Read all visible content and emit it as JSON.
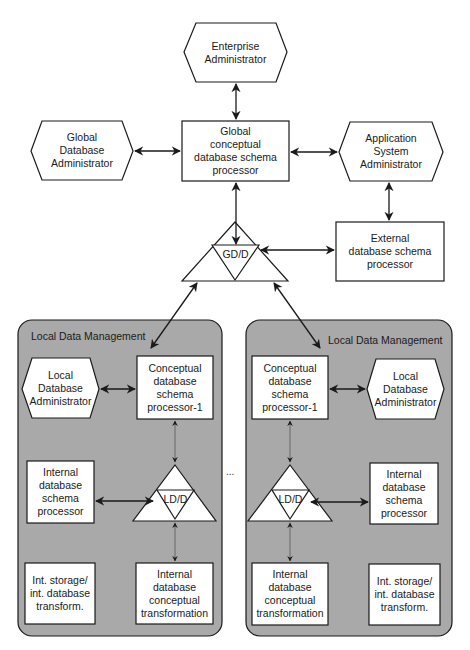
{
  "diagram": {
    "global": {
      "enterprise_admin": "Enterprise\nAdministrator",
      "global_db_admin": "Global\nDatabase\nAdministrator",
      "global_conceptual_processor": "Global\nconceptual\ndatabase schema\nprocessor",
      "application_system_admin": "Application\nSystem\nAdministrator",
      "external_processor": "External\ndatabase schema\nprocessor",
      "gdd": "GD/D"
    },
    "left_panel": {
      "title": "Local Data Management",
      "local_db_admin": "Local\nDatabase\nAdministrator",
      "conceptual_processor": "Conceptual\ndatabase\nschema\nprocessor-1",
      "internal_schema_processor": "Internal\ndatabase\nschema\nprocessor",
      "ldd": "LD/D",
      "int_storage": "Int. storage/\nint. database\ntransform.",
      "internal_conceptual_transformation": "Internal\ndatabase\nconceptual\ntransformation"
    },
    "right_panel": {
      "title": "Local Data Management",
      "local_db_admin": "Local\nDatabase\nAdministrator",
      "conceptual_processor": "Conceptual\ndatabase\nschema\nprocessor-1",
      "internal_schema_processor": "Internal\ndatabase\nschema\nprocessor",
      "ldd": "LD/D",
      "int_storage": "Int. storage/\nint. database\ntransform.",
      "internal_conceptual_transformation": "Internal\ndatabase\nconceptual\ntransformation"
    },
    "ellipsis": "...",
    "colors": {
      "panel_fill": "#a9a9a9",
      "stroke": "#1a1a1a",
      "box_fill": "#ffffff"
    }
  }
}
